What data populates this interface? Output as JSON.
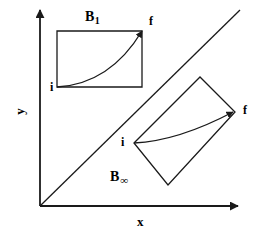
{
  "figure": {
    "title": "",
    "width": 266,
    "height": 238,
    "background_color": "#ffffff",
    "stroke_color": "#1a1a1a"
  },
  "axes": {
    "x_label": "x",
    "y_label": "y",
    "origin": [
      40,
      206
    ],
    "x_axis_tip": [
      240,
      206
    ],
    "y_axis_tip": [
      40,
      8
    ],
    "x_label_pos": [
      140,
      222
    ],
    "y_label_pos": [
      20,
      112
    ]
  },
  "diagonal": {
    "name": "identity-line",
    "from": [
      40,
      206
    ],
    "to": [
      240,
      10
    ]
  },
  "regions": [
    {
      "id": "B1",
      "label_base": "B",
      "label_sub": "1",
      "label_pos": [
        89,
        12
      ],
      "shape": "rectangle",
      "corners": [
        [
          57,
          31
        ],
        [
          142,
          31
        ],
        [
          142,
          87
        ],
        [
          57,
          87
        ]
      ],
      "start_label": "i",
      "start_point": [
        57,
        87
      ],
      "start_label_pos": [
        49,
        82
      ],
      "end_label": "f",
      "end_point": [
        142,
        31
      ],
      "end_label_pos": [
        149,
        17
      ],
      "path_curve": "M 57 87 Q 110 84 142 31"
    },
    {
      "id": "Binf",
      "label_base": "B",
      "label_sub": "∞",
      "label_pos": [
        112,
        172
      ],
      "shape": "rotated-rectangle",
      "corners": [
        [
          134,
          143
        ],
        [
          200,
          77
        ],
        [
          235,
          112
        ],
        [
          168,
          185
        ]
      ],
      "start_label": "i",
      "start_point": [
        134,
        143
      ],
      "start_label_pos": [
        122,
        136
      ],
      "end_label": "f",
      "end_point": [
        235,
        112
      ],
      "end_label_pos": [
        242,
        104
      ],
      "path_curve": "M 134 143 Q 178 141 235 112"
    }
  ]
}
